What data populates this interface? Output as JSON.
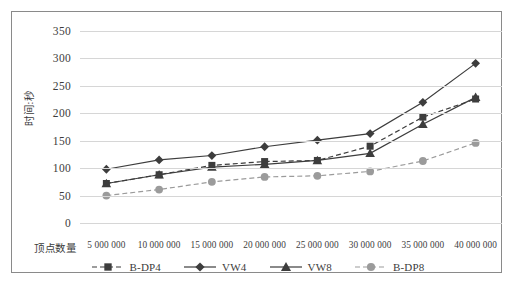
{
  "chart_data": {
    "type": "line",
    "title": "",
    "xlabel": "顶点数量",
    "ylabel": "时间:秒",
    "categories": [
      "5 000 000",
      "10 000 000",
      "15 000 000",
      "20 000 000",
      "25 000 000",
      "30 000 000",
      "35 000 000",
      "40 000 000"
    ],
    "x": [
      5000000,
      10000000,
      15000000,
      20000000,
      25000000,
      30000000,
      35000000,
      40000000
    ],
    "ylim": [
      0,
      350
    ],
    "ytick_labels": [
      "0",
      "50",
      "100",
      "150",
      "200",
      "250",
      "300",
      "350"
    ],
    "yticks": [
      0,
      50,
      100,
      150,
      200,
      250,
      300,
      350
    ],
    "grid": true,
    "legend_position": "bottom",
    "series": [
      {
        "name": "B-DP4",
        "values": [
          72,
          88,
          105,
          112,
          114,
          140,
          193,
          226
        ],
        "color": "#3d3d3d",
        "dash": "5,3",
        "marker": "square"
      },
      {
        "name": "VW4",
        "values": [
          98,
          115,
          123,
          139,
          151,
          163,
          220,
          291
        ],
        "color": "#3d3d3d",
        "dash": "",
        "marker": "diamond"
      },
      {
        "name": "VW8",
        "values": [
          72,
          88,
          102,
          107,
          114,
          127,
          180,
          229
        ],
        "color": "#3d3d3d",
        "dash": "",
        "marker": "triangle"
      },
      {
        "name": "B-DP8",
        "values": [
          50,
          61,
          75,
          84,
          86,
          94,
          113,
          146
        ],
        "color": "#9b9b9b",
        "dash": "5,3",
        "marker": "circle"
      }
    ]
  },
  "legend": {
    "items": [
      {
        "label": "B-DP4"
      },
      {
        "label": "VW4"
      },
      {
        "label": "VW8"
      },
      {
        "label": "B-DP8"
      }
    ]
  },
  "colors": {
    "frame_border": "#8a8a8a",
    "gridline": "#d6d6d6",
    "dark_series": "#3d3d3d",
    "light_series": "#9b9b9b",
    "text": "#3c3c3c",
    "background": "#ffffff"
  }
}
